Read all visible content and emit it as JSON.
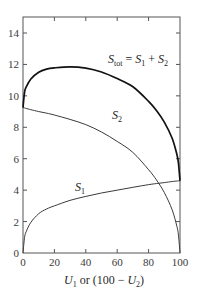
{
  "chart_data": {
    "type": "line",
    "title": "",
    "xlabel": "U1 or (100 − U2)",
    "ylabel": "",
    "xlim": [
      0,
      100
    ],
    "ylim": [
      0,
      15
    ],
    "x_ticks": [
      0,
      20,
      40,
      60,
      80,
      100
    ],
    "y_ticks": [
      0,
      2,
      4,
      6,
      8,
      10,
      12,
      14
    ],
    "grid": false,
    "legend": "inline labels",
    "x": [
      0,
      1,
      2,
      5,
      10,
      15,
      20,
      30,
      40,
      50,
      60,
      70,
      80,
      85,
      90,
      95,
      98,
      99,
      100
    ],
    "series": [
      {
        "name": "S1",
        "label": "S1",
        "color": "#3a3a3a",
        "values": [
          0,
          1.0,
          1.35,
          1.95,
          2.5,
          2.8,
          3.0,
          3.35,
          3.6,
          3.82,
          4.0,
          4.18,
          4.35,
          4.42,
          4.48,
          4.55,
          4.58,
          4.59,
          4.6
        ]
      },
      {
        "name": "S2",
        "label": "S2",
        "color": "#3a3a3a",
        "values": [
          9.25,
          9.23,
          9.2,
          9.12,
          9.0,
          8.9,
          8.78,
          8.5,
          8.17,
          7.7,
          7.1,
          6.4,
          5.3,
          4.65,
          3.85,
          2.75,
          1.7,
          1.15,
          0
        ]
      },
      {
        "name": "Stot",
        "label": "Stot = S1 + S2",
        "color": "#111111",
        "values": [
          9.25,
          10.23,
          10.55,
          11.07,
          11.5,
          11.7,
          11.78,
          11.85,
          11.77,
          11.52,
          11.1,
          10.58,
          9.65,
          9.07,
          8.33,
          7.3,
          6.28,
          5.74,
          4.6
        ]
      }
    ],
    "annotations": [
      {
        "text": "Stot = S1 + S2",
        "x": 70,
        "y": 12.8
      },
      {
        "text": "S2",
        "x": 57,
        "y": 8.6
      },
      {
        "text": "S1",
        "x": 34,
        "y": 4.2
      }
    ]
  },
  "labels": {
    "x_axis_main": "U",
    "x_axis_sub1": "1",
    "x_axis_mid": " or (100 − ",
    "x_axis_U2": "U",
    "x_axis_sub2": "2",
    "x_axis_end": ")",
    "stot_S": "S",
    "stot_sub": "tot",
    "stot_eq": " = ",
    "stot_S1": "S",
    "stot_sub1": "1",
    "stot_plus": " + ",
    "stot_S2": "S",
    "stot_sub2": "2",
    "s2_S": "S",
    "s2_sub": "2",
    "s1_S": "S",
    "s1_sub": "1"
  }
}
